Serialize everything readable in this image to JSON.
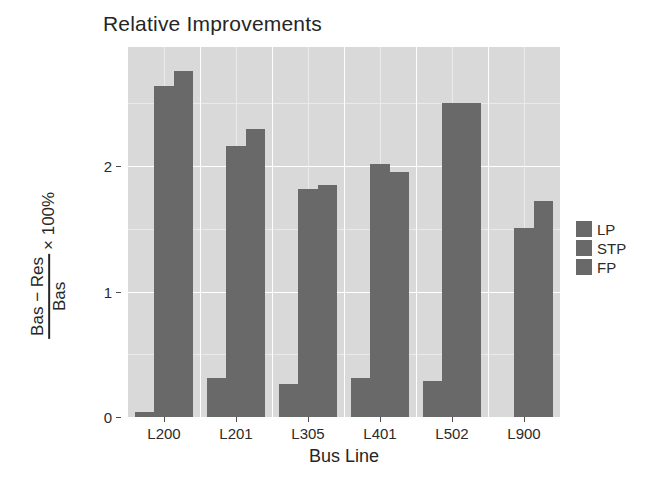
{
  "chart_data": {
    "type": "bar",
    "title": "Relative Improvements",
    "xlabel": "Bus Line",
    "ylabel_numerator": "Bas − Res",
    "ylabel_denominator": "Bas",
    "ylabel_suffix": "× 100%",
    "categories": [
      "L200",
      "L201",
      "L305",
      "L401",
      "L502",
      "L900"
    ],
    "series": [
      {
        "name": "LP",
        "values": [
          0.04,
          0.31,
          0.26,
          0.31,
          0.29,
          0.0
        ]
      },
      {
        "name": "STP",
        "values": [
          2.64,
          2.16,
          1.82,
          2.02,
          2.5,
          1.51
        ]
      },
      {
        "name": "FP",
        "values": [
          2.76,
          2.3,
          1.85,
          1.95,
          2.5,
          1.72
        ]
      }
    ],
    "yticks": [
      {
        "value": 0,
        "label": "0"
      },
      {
        "value": 1,
        "label": "1"
      },
      {
        "value": 2,
        "label": "2"
      }
    ],
    "ylim": [
      0,
      2.95
    ],
    "grid": true,
    "legend_position": "right",
    "colors": {
      "bar": "#696969",
      "panel_background": "#d9d9d9",
      "grid_major": "#ffffff",
      "grid_minor": "#eaeaea",
      "text": "#262626"
    }
  },
  "legend": {
    "items": [
      {
        "label": "LP"
      },
      {
        "label": "STP"
      },
      {
        "label": "FP"
      }
    ]
  }
}
